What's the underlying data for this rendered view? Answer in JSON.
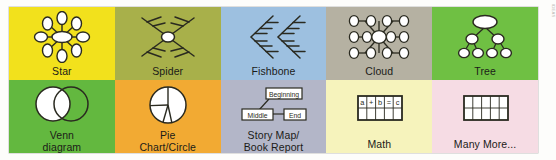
{
  "watermark": "IDEAS",
  "palette": {
    "star_bg": "#f2e11c",
    "spider_bg": "#a8b04a",
    "fishbone_bg": "#9dc0e0",
    "cloud_bg": "#b5b1a2",
    "tree_bg": "#6fc043",
    "venn_bg": "#63b83f",
    "pie_bg": "#f2aa33",
    "story_bg": "#b3b6c8",
    "math_bg": "#f6f3bc",
    "more_bg": "#f6dce4",
    "ink": "#2a2a20",
    "shape_fill": "#ffffff",
    "page_bg": "#fdfdfb"
  },
  "cells": [
    {
      "id": "star",
      "label": "Star",
      "bg": "#f2e11c",
      "icon": "star-diagram-icon",
      "diagram": {
        "type": "radial",
        "center": {
          "cx": 45,
          "cy": 26,
          "rx": 10,
          "ry": 5.5
        },
        "nodes": [
          {
            "cx": 45,
            "cy": 7,
            "rx": 5,
            "ry": 6.5
          },
          {
            "cx": 59.5,
            "cy": 12.5,
            "rx": 5,
            "ry": 6.5
          },
          {
            "cx": 66,
            "cy": 26,
            "rx": 6.5,
            "ry": 5
          },
          {
            "cx": 59.5,
            "cy": 39.5,
            "rx": 5,
            "ry": 6.5
          },
          {
            "cx": 45,
            "cy": 45,
            "rx": 5,
            "ry": 6.5
          },
          {
            "cx": 30.5,
            "cy": 39.5,
            "rx": 5,
            "ry": 6.5
          },
          {
            "cx": 24,
            "cy": 26,
            "rx": 6.5,
            "ry": 5
          },
          {
            "cx": 30.5,
            "cy": 12.5,
            "rx": 5,
            "ry": 6.5
          }
        ]
      }
    },
    {
      "id": "spider",
      "label": "Spider",
      "bg": "#a8b04a",
      "icon": "spider-diagram-icon",
      "diagram": {
        "type": "spider",
        "center": {
          "cx": 45,
          "cy": 26,
          "rx": 6.5,
          "ry": 5
        },
        "legs": 4,
        "ribs_per_leg": 2
      }
    },
    {
      "id": "fishbone",
      "label": "Fishbone",
      "bg": "#9dc0e0",
      "icon": "fishbone-diagram-icon",
      "diagram": {
        "type": "fishbone",
        "spines": 2,
        "ribs_per_spine": 3
      }
    },
    {
      "id": "cloud",
      "label": "Cloud",
      "bg": "#b5b1a2",
      "icon": "cloud-diagram-icon",
      "diagram": {
        "type": "grid-nodes",
        "rows": 3,
        "cols": 4,
        "center_enlarged": true
      }
    },
    {
      "id": "tree",
      "label": "Tree",
      "bg": "#6fc043",
      "icon": "tree-diagram-icon",
      "diagram": {
        "type": "tree",
        "levels": [
          1,
          2,
          4
        ]
      }
    },
    {
      "id": "venn",
      "label": "Venn\ndiagram",
      "label_lines": [
        "Venn",
        "diagram"
      ],
      "bg": "#63b83f",
      "icon": "venn-diagram-icon",
      "diagram": {
        "type": "venn",
        "circles": 2
      }
    },
    {
      "id": "pie",
      "label": "Pie\nChart/Circle",
      "label_lines": [
        "Pie",
        "Chart/Circle"
      ],
      "bg": "#f2aa33",
      "icon": "pie-chart-icon",
      "diagram": {
        "type": "pie",
        "slices": 4,
        "slice_angles_deg": [
          0,
          92,
          196,
          232
        ]
      }
    },
    {
      "id": "story-map",
      "label": "Story Map/\nBook Report",
      "label_lines": [
        "Story Map/",
        "Book Report"
      ],
      "bg": "#b3b6c8",
      "icon": "story-map-icon",
      "diagram": {
        "type": "flow-boxes",
        "boxes": [
          "Beginning",
          "Middle",
          "End"
        ]
      }
    },
    {
      "id": "math",
      "label": "Math",
      "bg": "#f6f3bc",
      "icon": "math-table-icon",
      "diagram": {
        "type": "table",
        "rows": 2,
        "cols": 5,
        "cells": [
          [
            "a",
            "+",
            "b",
            "=",
            "c"
          ],
          [
            "",
            "",
            "",
            "",
            ""
          ]
        ]
      }
    },
    {
      "id": "many-more",
      "label": "Many More...",
      "bg": "#f6dce4",
      "icon": "blank-table-icon",
      "diagram": {
        "type": "table",
        "rows": 2,
        "cols": 5,
        "cells": [
          [
            "",
            "",
            "",
            "",
            ""
          ],
          [
            "",
            "",
            "",
            "",
            ""
          ]
        ]
      }
    }
  ]
}
